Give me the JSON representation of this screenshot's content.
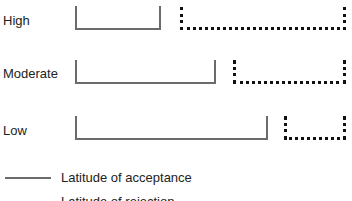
{
  "diagram": {
    "rows": [
      {
        "label": "High",
        "acceptance": {
          "x1": 75,
          "x2": 161
        },
        "rejection": {
          "x1": 180,
          "x2": 346
        }
      },
      {
        "label": "Moderate",
        "acceptance": {
          "x1": 75,
          "x2": 216
        },
        "rejection": {
          "x1": 233,
          "x2": 346
        }
      },
      {
        "label": "Low",
        "acceptance": {
          "x1": 75,
          "x2": 268
        },
        "rejection": {
          "x1": 284,
          "x2": 346
        }
      }
    ],
    "legend": [
      {
        "style": "solid",
        "label": "Latitude of acceptance"
      },
      {
        "style": "dotted",
        "label": "Latitude of rejection"
      }
    ]
  }
}
